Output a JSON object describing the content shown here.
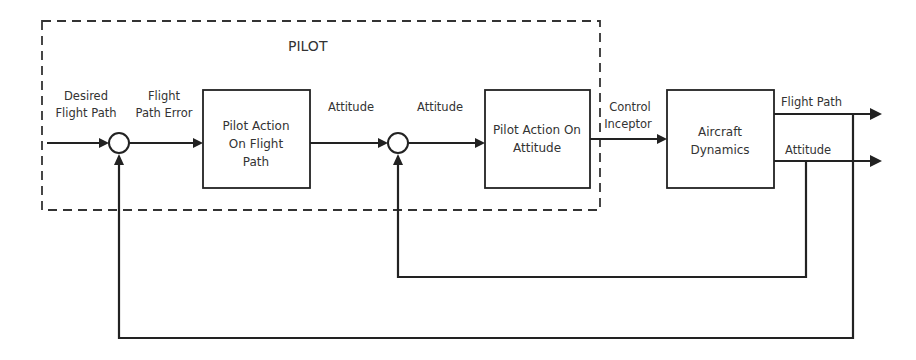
{
  "diagram": {
    "group": {
      "label": "PILOT"
    },
    "inputs": {
      "desired_flight_path": [
        "Desired",
        "Flight Path"
      ],
      "flight_path_error": [
        "Flight",
        "Path Error"
      ],
      "attitude_command": "Attitude",
      "attitude_error": "Attitude",
      "control_inceptor": [
        "Control",
        "Inceptor"
      ]
    },
    "blocks": [
      {
        "id": "pilot-action-flight-path",
        "lines": [
          "Pilot Action",
          "On Flight",
          "Path"
        ]
      },
      {
        "id": "pilot-action-attitude",
        "lines": [
          "Pilot Action On",
          "Attitude"
        ]
      },
      {
        "id": "aircraft-dynamics",
        "lines": [
          "Aircraft",
          "Dynamics"
        ]
      }
    ],
    "outputs": {
      "flight_path": "Flight Path",
      "attitude": "Attitude"
    },
    "colors": {
      "line": "#222222",
      "text": "#333333",
      "background": "#ffffff"
    }
  }
}
